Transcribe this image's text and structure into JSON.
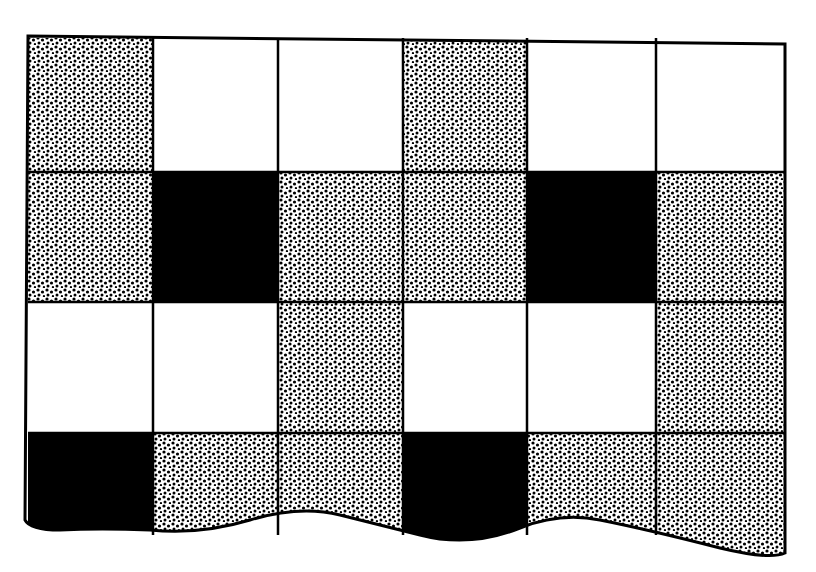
{
  "figure": {
    "columns": 6,
    "rows": 4,
    "legend": {
      "S": "stippled",
      "W": "white",
      "B": "black"
    },
    "cells": [
      [
        "S",
        "W",
        "W",
        "S",
        "W",
        "W"
      ],
      [
        "S",
        "B",
        "S",
        "S",
        "B",
        "S"
      ],
      [
        "W",
        "W",
        "S",
        "W",
        "W",
        "S"
      ],
      [
        "B",
        "S",
        "S",
        "B",
        "S",
        "S"
      ]
    ],
    "colors": {
      "black": "#000000",
      "white": "#ffffff",
      "stipple_dot": "#000000"
    }
  }
}
